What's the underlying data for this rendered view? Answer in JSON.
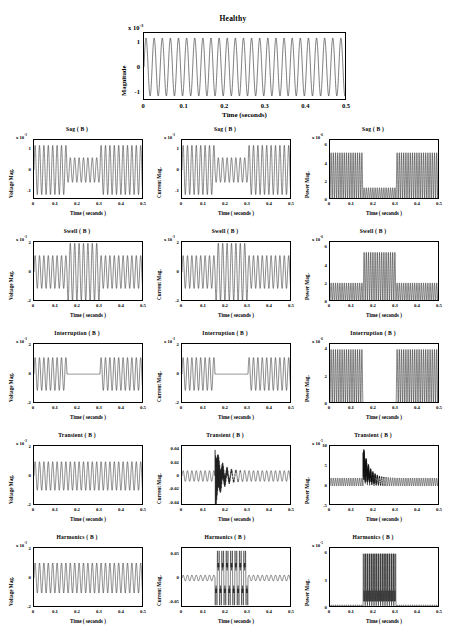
{
  "figure": {
    "xlabel": "Time ( seconds )",
    "xticks": [
      "0",
      "0.1",
      "0.2",
      "0.3",
      "0.4",
      "0.5"
    ],
    "exponent_prefix": "x 10",
    "columns": [
      {
        "key": "voltage",
        "ylabel": "Voltage  Mag."
      },
      {
        "key": "current",
        "ylabel": "Current  Mag."
      },
      {
        "key": "power",
        "ylabel": "Power  Mag."
      }
    ],
    "rows": [
      "Sag",
      "Swell",
      "Interruption",
      "Transient",
      "Harmonics"
    ]
  },
  "healthy": {
    "title": "Healthy",
    "ylabel": "Magnitude",
    "xlabel": "Time (seconds)",
    "exponent": "-3",
    "xticks": [
      "0",
      "0.1",
      "0.2",
      "0.3",
      "0.4",
      "0.5"
    ],
    "yticks": [
      "1",
      "0",
      "-1"
    ]
  },
  "chart_data": {
    "type": "line",
    "xlabel": "Time ( seconds )",
    "xlim": [
      0,
      0.5
    ],
    "grid": false,
    "legend": "none",
    "panels": [
      {
        "id": "healthy",
        "row": "Healthy",
        "column": "magnitude",
        "title": "Healthy",
        "ylabel": "Magnitude",
        "y_exponent": "-3",
        "ylim": [
          -1.35,
          1.35
        ],
        "yticks": [
          1,
          0,
          -1
        ],
        "waveform": "pure-sine",
        "frequency_hz": 50,
        "amplitude": 1.15,
        "events": []
      },
      {
        "id": "sag-voltage",
        "row": "Sag",
        "column": "voltage",
        "title": "Sag ( B )",
        "ylabel": "Voltage  Mag.",
        "y_exponent": "-3",
        "ylim": [
          -1.4,
          1.4
        ],
        "yticks": [
          1,
          0,
          -1
        ],
        "waveform": "sine-with-sag",
        "amplitude": 1.15,
        "events": [
          {
            "type": "sag",
            "start": 0.15,
            "end": 0.3,
            "amplitude_factor": 0.5
          }
        ]
      },
      {
        "id": "sag-current",
        "row": "Sag",
        "column": "current",
        "title": "Sag ( B )",
        "ylabel": "Current  Mag.",
        "y_exponent": "-3",
        "ylim": [
          -1.4,
          1.4
        ],
        "yticks": [
          1,
          0,
          -1
        ],
        "waveform": "sine-with-sag",
        "amplitude": 1.15,
        "events": [
          {
            "type": "sag",
            "start": 0.15,
            "end": 0.3,
            "amplitude_factor": 0.5
          }
        ]
      },
      {
        "id": "sag-power",
        "row": "Sag",
        "column": "power",
        "title": "Sag ( B )",
        "ylabel": "Power  Mag.",
        "y_exponent": "-6",
        "ylim": [
          0,
          6.6
        ],
        "yticks": [
          6,
          4,
          2,
          0
        ],
        "waveform": "rectified-power-with-sag",
        "amplitude": 5.2,
        "events": [
          {
            "type": "sag",
            "start": 0.15,
            "end": 0.3,
            "amplitude_factor": 0.26
          }
        ]
      },
      {
        "id": "swell-voltage",
        "row": "Swell",
        "column": "voltage",
        "title": "Swell ( B )",
        "ylabel": "Voltage  Mag.",
        "y_exponent": "-3",
        "ylim": [
          -2.1,
          2.1
        ],
        "yticks": [
          2,
          0,
          -2
        ],
        "waveform": "sine-with-swell",
        "amplitude": 1.15,
        "events": [
          {
            "type": "swell",
            "start": 0.15,
            "end": 0.3,
            "amplitude_factor": 1.75
          }
        ]
      },
      {
        "id": "swell-current",
        "row": "Swell",
        "column": "current",
        "title": "Swell ( B )",
        "ylabel": "Current  Mag.",
        "y_exponent": "-3",
        "ylim": [
          -2.1,
          2.1
        ],
        "yticks": [
          2,
          0,
          -2
        ],
        "waveform": "sine-with-swell",
        "amplitude": 1.15,
        "events": [
          {
            "type": "swell",
            "start": 0.15,
            "end": 0.3,
            "amplitude_factor": 1.75
          }
        ]
      },
      {
        "id": "swell-power",
        "row": "Swell",
        "column": "power",
        "title": "Swell ( B )",
        "ylabel": "Power  Mag.",
        "y_exponent": "-6",
        "ylim": [
          0,
          6.6
        ],
        "yticks": [
          6,
          4,
          2,
          0
        ],
        "waveform": "rectified-power-with-swell",
        "amplitude": 2.1,
        "events": [
          {
            "type": "swell",
            "start": 0.15,
            "end": 0.3,
            "amplitude_factor": 2.6
          }
        ]
      },
      {
        "id": "interruption-voltage",
        "row": "Interruption",
        "column": "voltage",
        "title": "Interruption ( B )",
        "ylabel": "Voltage  Mag.",
        "y_exponent": "-3",
        "ylim": [
          -2.1,
          2.1
        ],
        "yticks": [
          2,
          0,
          -2
        ],
        "waveform": "sine-with-interruption",
        "amplitude": 1.15,
        "events": [
          {
            "type": "interruption",
            "start": 0.15,
            "end": 0.3,
            "amplitude_factor": 0.0
          }
        ]
      },
      {
        "id": "interruption-current",
        "row": "Interruption",
        "column": "current",
        "title": "Interruption ( B )",
        "ylabel": "Current  Mag.",
        "y_exponent": "-3",
        "ylim": [
          -2.1,
          2.1
        ],
        "yticks": [
          2,
          0,
          -2
        ],
        "waveform": "sine-with-interruption",
        "amplitude": 1.15,
        "events": [
          {
            "type": "interruption",
            "start": 0.15,
            "end": 0.3,
            "amplitude_factor": 0.0
          }
        ]
      },
      {
        "id": "interruption-power",
        "row": "Interruption",
        "column": "power",
        "title": "Interruption ( B )",
        "ylabel": "Power  Mag.",
        "y_exponent": "-6",
        "ylim": [
          0,
          4.4
        ],
        "yticks": [
          4,
          2,
          0
        ],
        "waveform": "rectified-power-with-interruption",
        "amplitude": 4.0,
        "events": [
          {
            "type": "interruption",
            "start": 0.15,
            "end": 0.3,
            "amplitude_factor": 0.0
          }
        ]
      },
      {
        "id": "transient-voltage",
        "row": "Transient",
        "column": "voltage",
        "title": "Transient ( B )",
        "ylabel": "Voltage  Mag.",
        "y_exponent": "-3",
        "ylim": [
          -2.1,
          2.1
        ],
        "yticks": [
          2,
          0,
          -2
        ],
        "waveform": "pure-sine",
        "amplitude": 1.0,
        "events": []
      },
      {
        "id": "transient-current",
        "row": "Transient",
        "column": "current",
        "title": "Transient ( B )",
        "ylabel": "Current  Mag.",
        "y_exponent": "",
        "ylim": [
          -0.045,
          0.045
        ],
        "yticks": [
          0.04,
          0.02,
          0,
          -0.02,
          -0.04
        ],
        "ytick_labels": [
          "0.04",
          "0.02",
          "0",
          "-0.02",
          "-0.04"
        ],
        "waveform": "sine-with-transient-spike",
        "amplitude": 0.008,
        "events": [
          {
            "type": "transient",
            "start": 0.15,
            "peak": 0.165,
            "end": 0.3,
            "peak_amplitude": 0.042
          }
        ]
      },
      {
        "id": "transient-power",
        "row": "Transient",
        "column": "power",
        "title": "Transient ( B )",
        "ylabel": "Power  Mag.",
        "y_exponent": "-5",
        "ylim": [
          -5,
          10
        ],
        "yticks": [
          10,
          5,
          0,
          -5
        ],
        "waveform": "power-with-transient-spike",
        "amplitude": 2.0,
        "events": [
          {
            "type": "transient",
            "start": 0.15,
            "peak": 0.165,
            "end": 0.3,
            "peak_amplitude": 9.5
          }
        ]
      },
      {
        "id": "harmonics-voltage",
        "row": "Harmonics",
        "column": "voltage",
        "title": "Harmonics ( B )",
        "ylabel": "Voltage  Mag.",
        "y_exponent": "-3",
        "ylim": [
          -2.1,
          2.1
        ],
        "yticks": [
          2,
          0,
          -2
        ],
        "waveform": "pure-sine",
        "amplitude": 1.05,
        "events": []
      },
      {
        "id": "harmonics-current",
        "row": "Harmonics",
        "column": "current",
        "title": "Harmonics ( B )",
        "ylabel": "Current  Mag.",
        "y_exponent": "",
        "ylim": [
          -0.062,
          0.062
        ],
        "yticks": [
          0.05,
          0,
          -0.05
        ],
        "ytick_labels": [
          "0.05",
          "0",
          "-0.05"
        ],
        "waveform": "sine-with-harmonic-burst",
        "amplitude": 0.006,
        "events": [
          {
            "type": "harmonics",
            "start": 0.15,
            "end": 0.3,
            "amplitude": 0.052
          }
        ]
      },
      {
        "id": "harmonics-power",
        "row": "Harmonics",
        "column": "power",
        "title": "Harmonics ( B )",
        "ylabel": "Power  Mag.",
        "y_exponent": "-5",
        "ylim": [
          0,
          6.6
        ],
        "yticks": [
          6,
          3,
          0
        ],
        "ytick_labels": [
          "6",
          "3",
          "0"
        ],
        "waveform": "power-with-harmonic-burst",
        "amplitude": 0.35,
        "events": [
          {
            "type": "harmonics",
            "start": 0.15,
            "end": 0.3,
            "amplitude": 6.0
          }
        ]
      }
    ]
  }
}
